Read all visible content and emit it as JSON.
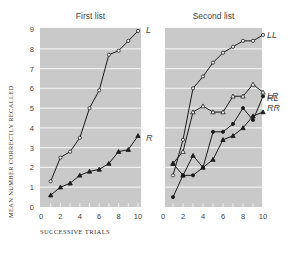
{
  "chart_data": [
    {
      "type": "line",
      "title": "First list",
      "xlabel": "SUCCESSIVE TRIALS",
      "ylabel": "MEAN NUMBER CORRECTLY RECALLED",
      "x": [
        1,
        2,
        3,
        4,
        5,
        6,
        7,
        8,
        9,
        10
      ],
      "xticks": [
        "0",
        "2",
        "4",
        "6",
        "8",
        "10"
      ],
      "yticks": [
        "0",
        "1",
        "2",
        "3",
        "4",
        "5",
        "6",
        "7",
        "8",
        "9"
      ],
      "xlim": [
        0,
        10
      ],
      "ylim": [
        0,
        9
      ],
      "grid": true,
      "series": [
        {
          "name": "L",
          "marker": "open-circle",
          "values": [
            1.3,
            2.5,
            2.8,
            3.5,
            5.0,
            5.9,
            7.7,
            7.9,
            8.4,
            8.9
          ]
        },
        {
          "name": "R",
          "marker": "filled-triangle",
          "values": [
            0.6,
            1.0,
            1.2,
            1.6,
            1.8,
            1.9,
            2.2,
            2.8,
            2.9,
            3.6
          ]
        }
      ]
    },
    {
      "type": "line",
      "title": "Second list",
      "xlabel": "SUCCESSIVE TRIALS",
      "ylabel": "MEAN NUMBER CORRECTLY RECALLED",
      "x": [
        1,
        2,
        3,
        4,
        5,
        6,
        7,
        8,
        9,
        10
      ],
      "xticks": [
        "0",
        "2",
        "4",
        "6",
        "8",
        "10"
      ],
      "xlim": [
        0,
        10
      ],
      "ylim": [
        0,
        9
      ],
      "grid": true,
      "series": [
        {
          "name": "LL",
          "marker": "open-circle",
          "values": [
            1.6,
            3.4,
            6.0,
            6.6,
            7.3,
            7.8,
            8.1,
            8.4,
            8.4,
            8.7
          ]
        },
        {
          "name": "RL",
          "marker": "open-triangle",
          "values": [
            2.2,
            2.8,
            4.8,
            5.1,
            4.8,
            4.8,
            5.6,
            5.6,
            6.2,
            5.8
          ]
        },
        {
          "name": "LR",
          "marker": "filled-circle",
          "values": [
            0.5,
            1.6,
            1.6,
            2.0,
            3.8,
            3.8,
            4.2,
            5.0,
            4.4,
            5.6
          ]
        },
        {
          "name": "RR",
          "marker": "filled-triangle",
          "values": [
            2.2,
            1.6,
            2.6,
            2.0,
            2.4,
            3.4,
            3.6,
            4.0,
            4.6,
            4.8
          ]
        }
      ]
    }
  ],
  "labels": {
    "left_title": "First list",
    "right_title": "Second list",
    "ylabel": "MEAN NUMBER CORRECTLY RECALLED",
    "xlabel": "SUCCESSIVE TRIALS"
  },
  "colors": {
    "plot_bg": "#c9c9c9",
    "grid": "#efefef",
    "line": "#1a1a1a",
    "text": "#444444"
  }
}
